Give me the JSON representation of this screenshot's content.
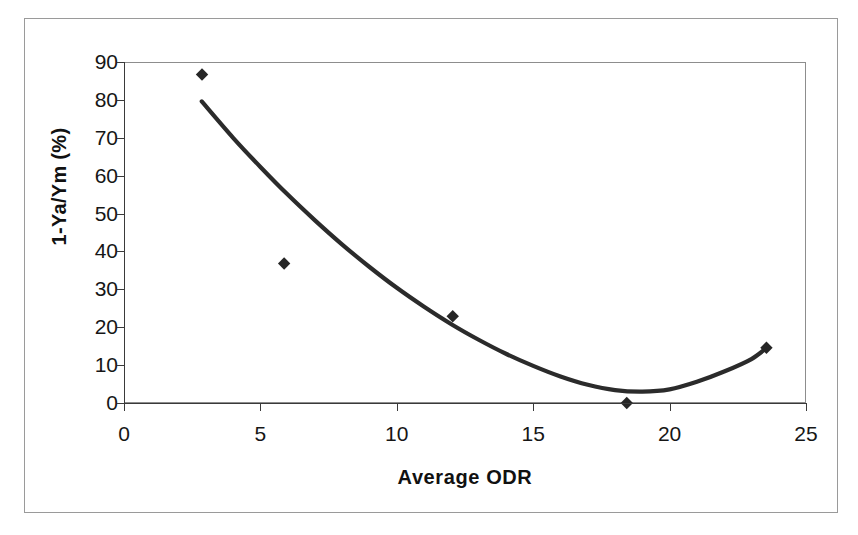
{
  "chart_data": {
    "type": "scatter",
    "title": "",
    "xlabel": "Average ODR",
    "ylabel": "1-Ya/Ym (%)",
    "xlim": [
      0,
      25
    ],
    "ylim": [
      0,
      90
    ],
    "xticks": [
      0,
      5,
      10,
      15,
      20,
      25
    ],
    "yticks": [
      0,
      10,
      20,
      30,
      40,
      50,
      60,
      70,
      80,
      90
    ],
    "grid": false,
    "legend": null,
    "series": [
      {
        "name": "observed",
        "kind": "scatter",
        "marker": "diamond",
        "color": "#262626",
        "points": [
          {
            "x": 2.86,
            "y": 86.7
          },
          {
            "x": 5.87,
            "y": 36.8
          },
          {
            "x": 12.05,
            "y": 22.9
          },
          {
            "x": 18.43,
            "y": 0.0
          },
          {
            "x": 23.55,
            "y": 14.6
          }
        ]
      },
      {
        "name": "fitted-curve",
        "kind": "line",
        "color": "#2b2b2b",
        "points": [
          {
            "x": 2.85,
            "y": 79.6
          },
          {
            "x": 4.0,
            "y": 70.0
          },
          {
            "x": 5.0,
            "y": 62.3
          },
          {
            "x": 6.0,
            "y": 55.0
          },
          {
            "x": 7.0,
            "y": 48.2
          },
          {
            "x": 8.0,
            "y": 41.8
          },
          {
            "x": 9.0,
            "y": 35.9
          },
          {
            "x": 10.0,
            "y": 30.4
          },
          {
            "x": 11.0,
            "y": 25.4
          },
          {
            "x": 12.0,
            "y": 20.8
          },
          {
            "x": 13.0,
            "y": 16.7
          },
          {
            "x": 14.0,
            "y": 13.0
          },
          {
            "x": 15.0,
            "y": 9.8
          },
          {
            "x": 16.0,
            "y": 7.0
          },
          {
            "x": 17.0,
            "y": 4.8
          },
          {
            "x": 18.0,
            "y": 3.4
          },
          {
            "x": 19.0,
            "y": 3.0
          },
          {
            "x": 20.0,
            "y": 3.6
          },
          {
            "x": 21.0,
            "y": 5.6
          },
          {
            "x": 22.0,
            "y": 8.3
          },
          {
            "x": 23.0,
            "y": 11.6
          },
          {
            "x": 23.6,
            "y": 14.8
          }
        ]
      }
    ]
  },
  "axes": {
    "x_title": "Average ODR",
    "y_title": "1-Ya/Ym (%)",
    "x_tick_labels": [
      "0",
      "5",
      "10",
      "15",
      "20",
      "25"
    ],
    "y_tick_labels": [
      "0",
      "10",
      "20",
      "30",
      "40",
      "50",
      "60",
      "70",
      "80",
      "90"
    ]
  },
  "colors": {
    "marker": "#262626",
    "curve": "#2b2b2b",
    "axis": "#3a3a3a",
    "frame": "#9a9a9a",
    "plot_border": "#8d8d8d",
    "background": "#ffffff",
    "text": "#161616"
  }
}
